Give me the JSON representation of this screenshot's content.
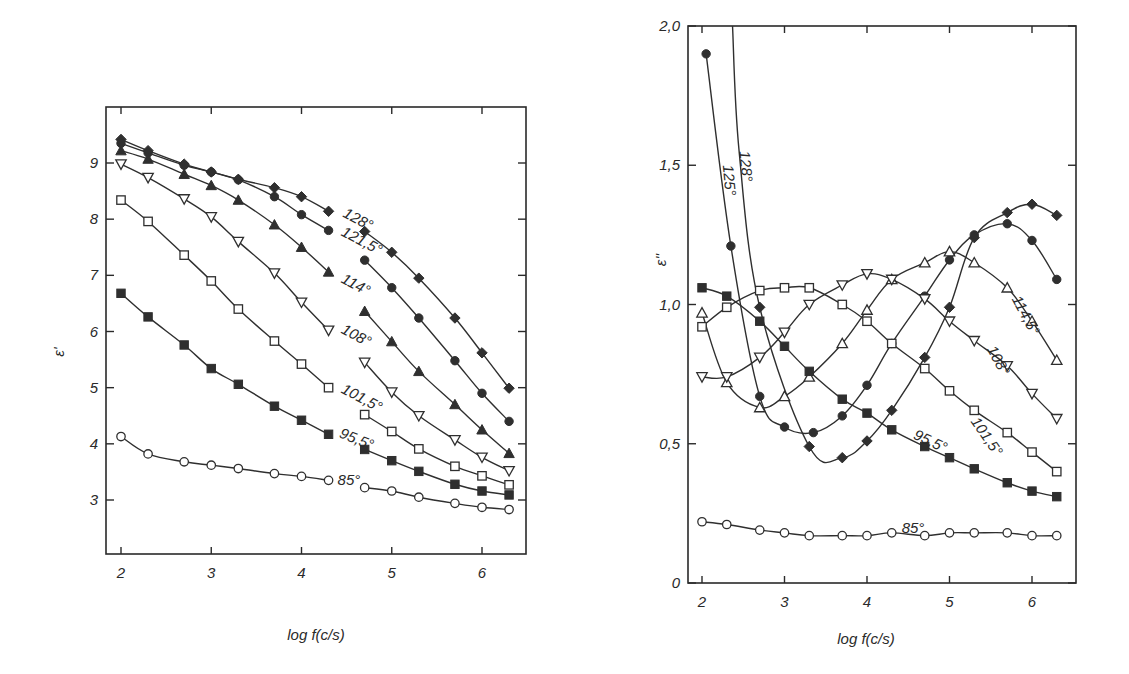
{
  "chart_data": [
    {
      "id": "left",
      "type": "line",
      "title": "",
      "xlabel": "log f(c/s)",
      "ylabel": "ε'",
      "xlim": [
        1.85,
        6.45
      ],
      "ylim": [
        1.9,
        9.8
      ],
      "xticks": [
        2,
        3,
        4,
        5,
        6
      ],
      "xtick_labels": [
        "2",
        "3",
        "4",
        "5",
        "6"
      ],
      "yticks": [
        3,
        4,
        5,
        6,
        7,
        8,
        9
      ],
      "ytick_labels": [
        "3",
        "4",
        "5",
        "6",
        "7",
        "8",
        "9"
      ],
      "grid": false,
      "legend": "inline curve labels",
      "x": [
        2,
        2.3,
        2.7,
        3,
        3.3,
        3.7,
        4,
        4.3,
        4.7,
        5,
        5.3,
        5.7,
        6,
        6.3
      ],
      "series": [
        {
          "name": "128°",
          "marker": "diamond-filled",
          "label_at": [
            4.45,
            8.05
          ],
          "label_rot": 28,
          "values": [
            9.42,
            9.22,
            8.98,
            8.84,
            8.71,
            8.56,
            8.4,
            8.14,
            7.78,
            7.41,
            6.95,
            6.24,
            5.62,
            4.99
          ]
        },
        {
          "name": "121,5°",
          "marker": "circle-filled",
          "label_at": [
            4.43,
            7.72
          ],
          "label_rot": 28,
          "values": [
            9.35,
            9.18,
            8.96,
            8.84,
            8.7,
            8.4,
            8.08,
            7.8,
            7.27,
            6.78,
            6.24,
            5.48,
            4.9,
            4.4
          ]
        },
        {
          "name": "114°",
          "marker": "triangle-up-filled",
          "label_at": [
            4.43,
            6.88
          ],
          "label_rot": 28,
          "values": [
            9.22,
            9.07,
            8.8,
            8.6,
            8.34,
            7.9,
            7.5,
            7.06,
            6.36,
            5.82,
            5.29,
            4.7,
            4.25,
            3.83
          ]
        },
        {
          "name": "108°",
          "marker": "triangle-down-open",
          "label_at": [
            4.43,
            5.98
          ],
          "label_rot": 28,
          "values": [
            8.98,
            8.74,
            8.36,
            8.04,
            7.6,
            7.04,
            6.52,
            6.02,
            5.45,
            4.92,
            4.5,
            4.07,
            3.76,
            3.52
          ]
        },
        {
          "name": "101,5°",
          "marker": "square-open",
          "label_at": [
            4.43,
            4.92
          ],
          "label_rot": 28,
          "values": [
            8.34,
            7.96,
            7.36,
            6.9,
            6.4,
            5.83,
            5.42,
            5.0,
            4.52,
            4.22,
            3.91,
            3.6,
            3.43,
            3.27
          ]
        },
        {
          "name": "95,5°",
          "marker": "square-filled",
          "label_at": [
            4.41,
            4.12
          ],
          "label_rot": 22,
          "values": [
            6.68,
            6.26,
            5.76,
            5.34,
            5.06,
            4.67,
            4.42,
            4.17,
            3.9,
            3.7,
            3.51,
            3.28,
            3.16,
            3.09
          ]
        },
        {
          "name": "85°",
          "marker": "circle-open",
          "label_at": [
            4.4,
            3.27
          ],
          "label_rot": 0,
          "values": [
            4.13,
            3.82,
            3.68,
            3.62,
            3.56,
            3.47,
            3.42,
            3.35,
            3.22,
            3.16,
            3.05,
            2.94,
            2.87,
            2.83
          ]
        }
      ]
    },
    {
      "id": "right",
      "type": "line",
      "title": "",
      "xlabel": "log f(c/s)",
      "ylabel": "ε''",
      "xlim": [
        1.82,
        6.52
      ],
      "ylim": [
        0,
        2.0
      ],
      "xticks": [
        2,
        3,
        4,
        5,
        6
      ],
      "xtick_labels": [
        "2",
        "3",
        "4",
        "5",
        "6"
      ],
      "yticks": [
        0,
        0.5,
        1.0,
        1.5,
        2.0
      ],
      "ytick_labels": [
        "0",
        "0,5",
        "1,0",
        "1,5",
        "2,0"
      ],
      "grid": false,
      "legend": "inline curve labels",
      "x": [
        2,
        2.3,
        2.7,
        3,
        3.3,
        3.7,
        4,
        4.3,
        4.7,
        5,
        5.3,
        5.7,
        6,
        6.3
      ],
      "series": [
        {
          "name": "128°",
          "marker": "diamond-filled",
          "label_at": [
            2.45,
            1.55
          ],
          "label_rot": 84,
          "points": [
            [
              2.7,
              0.99
            ],
            [
              3.3,
              0.49
            ],
            [
              3.7,
              0.45
            ],
            [
              4.0,
              0.51
            ],
            [
              4.3,
              0.62
            ],
            [
              4.7,
              0.81
            ],
            [
              5.0,
              0.99
            ],
            [
              5.3,
              1.24
            ],
            [
              5.7,
              1.33
            ],
            [
              6.0,
              1.36
            ],
            [
              6.3,
              1.32
            ]
          ],
          "curve_from_top": [
            [
              2.37,
              2.0
            ],
            [
              2.45,
              1.55
            ]
          ]
        },
        {
          "name": "125°",
          "marker": "circle-filled",
          "label_at": [
            2.25,
            1.5
          ],
          "label_rot": 84,
          "points": [
            [
              2.05,
              1.9
            ],
            [
              2.35,
              1.21
            ],
            [
              2.7,
              0.67
            ],
            [
              3.0,
              0.56
            ],
            [
              3.35,
              0.54
            ],
            [
              3.7,
              0.6
            ],
            [
              4.0,
              0.71
            ],
            [
              4.3,
              0.86
            ],
            [
              4.7,
              1.03
            ],
            [
              5.0,
              1.16
            ],
            [
              5.3,
              1.25
            ],
            [
              5.7,
              1.29
            ],
            [
              6.0,
              1.23
            ],
            [
              6.3,
              1.09
            ]
          ]
        },
        {
          "name": "114,5°",
          "marker": "triangle-up-open",
          "label_at": [
            5.75,
            1.02
          ],
          "label_rot": 62,
          "points": [
            [
              2.0,
              0.97
            ],
            [
              2.3,
              0.72
            ],
            [
              2.7,
              0.63
            ],
            [
              3.0,
              0.67
            ],
            [
              3.3,
              0.74
            ],
            [
              3.7,
              0.86
            ],
            [
              4.0,
              0.98
            ],
            [
              4.3,
              1.09
            ],
            [
              4.7,
              1.15
            ],
            [
              5.0,
              1.19
            ],
            [
              5.3,
              1.15
            ],
            [
              5.7,
              1.06
            ],
            [
              6.0,
              0.94
            ],
            [
              6.3,
              0.8
            ]
          ]
        },
        {
          "name": "108°",
          "marker": "triangle-down-open",
          "label_at": [
            5.45,
            0.84
          ],
          "label_rot": 62,
          "points": [
            [
              2.0,
              0.74
            ],
            [
              2.3,
              0.74
            ],
            [
              2.7,
              0.81
            ],
            [
              3.0,
              0.9
            ],
            [
              3.3,
              1.0
            ],
            [
              3.7,
              1.07
            ],
            [
              4.0,
              1.11
            ],
            [
              4.3,
              1.09
            ],
            [
              4.7,
              1.02
            ],
            [
              5.0,
              0.94
            ],
            [
              5.3,
              0.87
            ],
            [
              5.7,
              0.78
            ],
            [
              6.0,
              0.68
            ],
            [
              6.3,
              0.59
            ]
          ]
        },
        {
          "name": "101,5°",
          "marker": "square-open",
          "label_at": [
            5.25,
            0.58
          ],
          "label_rot": 55,
          "points": [
            [
              2.0,
              0.92
            ],
            [
              2.3,
              0.99
            ],
            [
              2.7,
              1.05
            ],
            [
              3.0,
              1.06
            ],
            [
              3.3,
              1.06
            ],
            [
              3.7,
              1.0
            ],
            [
              4.0,
              0.94
            ],
            [
              4.3,
              0.86
            ],
            [
              4.7,
              0.77
            ],
            [
              5.0,
              0.69
            ],
            [
              5.3,
              0.62
            ],
            [
              5.7,
              0.54
            ],
            [
              6.0,
              0.47
            ],
            [
              6.3,
              0.4
            ]
          ]
        },
        {
          "name": "95,5°",
          "marker": "square-filled",
          "label_at": [
            4.55,
            0.52
          ],
          "label_rot": 25,
          "points": [
            [
              2.0,
              1.06
            ],
            [
              2.3,
              1.03
            ],
            [
              2.7,
              0.94
            ],
            [
              3.0,
              0.85
            ],
            [
              3.3,
              0.76
            ],
            [
              3.7,
              0.66
            ],
            [
              4.0,
              0.61
            ],
            [
              4.3,
              0.55
            ],
            [
              4.7,
              0.49
            ],
            [
              5.0,
              0.45
            ],
            [
              5.3,
              0.41
            ],
            [
              5.7,
              0.36
            ],
            [
              6.0,
              0.33
            ],
            [
              6.3,
              0.31
            ]
          ]
        },
        {
          "name": "85°",
          "marker": "circle-open",
          "label_at": [
            4.42,
            0.18
          ],
          "label_rot": 0,
          "points": [
            [
              2.0,
              0.22
            ],
            [
              2.3,
              0.21
            ],
            [
              2.7,
              0.19
            ],
            [
              3.0,
              0.18
            ],
            [
              3.3,
              0.17
            ],
            [
              3.7,
              0.17
            ],
            [
              4.0,
              0.17
            ],
            [
              4.3,
              0.18
            ],
            [
              4.7,
              0.17
            ],
            [
              5.0,
              0.18
            ],
            [
              5.3,
              0.18
            ],
            [
              5.7,
              0.18
            ],
            [
              6.0,
              0.17
            ],
            [
              6.3,
              0.17
            ]
          ]
        }
      ]
    }
  ]
}
